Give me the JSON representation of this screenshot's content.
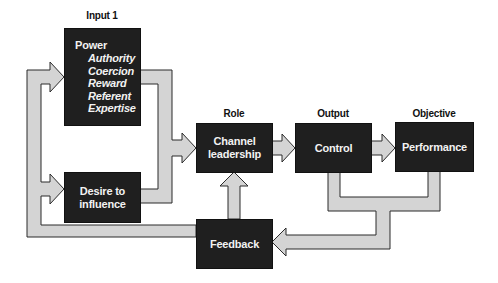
{
  "diagram": {
    "columns": [
      {
        "id": "input",
        "label": "Input 1"
      },
      {
        "id": "role",
        "label": "Role"
      },
      {
        "id": "output",
        "label": "Output"
      },
      {
        "id": "objective",
        "label": "Objective"
      }
    ],
    "nodes": {
      "power": {
        "title": "Power",
        "items": [
          "Authority",
          "Coercion",
          "Reward",
          "Referent",
          "Expertise"
        ]
      },
      "desire": {
        "line1": "Desire to",
        "line2": "influence"
      },
      "channel": {
        "line1": "Channel",
        "line2": "leadership"
      },
      "control": {
        "label": "Control"
      },
      "performance": {
        "label": "Performance"
      },
      "feedback": {
        "label": "Feedback"
      }
    },
    "edges": [
      {
        "from": "power",
        "to": "channel"
      },
      {
        "from": "desire",
        "to": "channel"
      },
      {
        "from": "channel",
        "to": "control"
      },
      {
        "from": "control",
        "to": "performance"
      },
      {
        "from": "control",
        "to": "feedback"
      },
      {
        "from": "performance",
        "to": "feedback"
      },
      {
        "from": "feedback",
        "to": "channel"
      },
      {
        "from": "feedback",
        "to": "power"
      },
      {
        "from": "feedback",
        "to": "desire"
      }
    ],
    "colors": {
      "box_fill": "#1f1f1f",
      "arrow_fill": "#d4d4d4",
      "arrow_stroke": "#2a2a2a",
      "box_text": "#f2f2f2"
    }
  }
}
